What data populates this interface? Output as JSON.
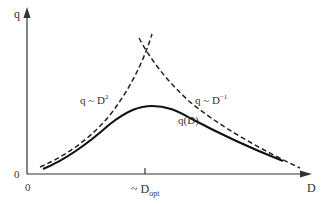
{
  "diagram": {
    "y_axis_label": "q",
    "x_axis_label": "D",
    "y_origin_label": "0",
    "x_origin_label": "0",
    "tick_label_prefix": "~ D",
    "tick_label_sub": "opt",
    "curves": [
      {
        "id": "rising",
        "style": "dashed",
        "label_main": "q ~ D",
        "label_sup": "2"
      },
      {
        "id": "falling",
        "style": "dashed",
        "label_main": "q ~ D",
        "label_sup": "−1"
      },
      {
        "id": "solid",
        "style": "solid",
        "label_main": "q(D)"
      }
    ],
    "colors": {
      "line": "#222222",
      "axis": "#333333",
      "text": "#333333",
      "background": "#ffffff"
    }
  }
}
